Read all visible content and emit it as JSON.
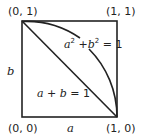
{
  "diagram": {
    "colors": {
      "stroke": "#222222",
      "background": "#ffffff"
    },
    "corners": {
      "top_left": "(0, 1)",
      "top_right": "(1, 1)",
      "bottom_left": "(0, 0)",
      "bottom_right": "(1, 0)"
    },
    "axes": {
      "x_label": "a",
      "y_label": "b"
    },
    "curves": {
      "circle": {
        "lhs_a": "a",
        "lhs_a_exp": "2",
        "plus": " +",
        "lhs_b": "b",
        "lhs_b_exp": "2",
        "rhs": " = 1"
      },
      "line": {
        "lhs_a": "a",
        "op": " + ",
        "lhs_b": "b",
        "rhs": " = 1"
      }
    }
  }
}
